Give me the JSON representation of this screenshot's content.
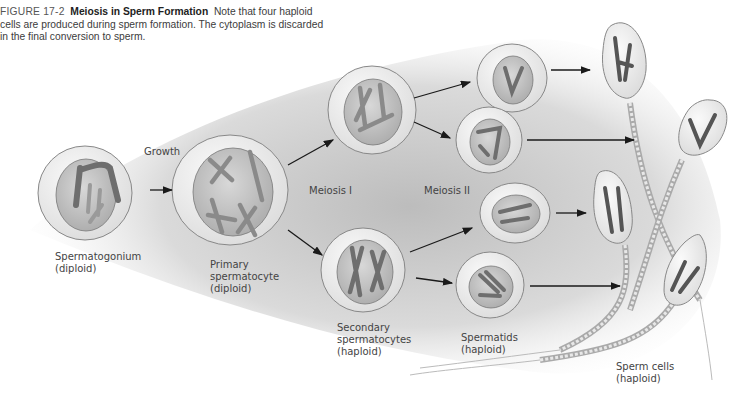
{
  "caption": {
    "figure_number": "FIGURE 17-2",
    "title": "Meiosis in Sperm Formation",
    "text": "Note that four haploid cells are produced during sperm formation. The cytoplasm is discarded in the final conversion to sperm."
  },
  "labels": {
    "growth": "Growth",
    "meiosis_1": "Meiosis I",
    "meiosis_2": "Meiosis II",
    "spermatogonium": [
      "Spermatogonium",
      "(diploid)"
    ],
    "primary": [
      "Primary",
      "spermatocyte",
      "(diploid)"
    ],
    "secondary": [
      "Secondary",
      "spermatocytes",
      "(haploid)"
    ],
    "spermatids": [
      "Spermatids",
      "(haploid)"
    ],
    "sperm": [
      "Sperm cells",
      "(haploid)"
    ]
  },
  "colors": {
    "cell_outer": "#f2f2f2",
    "cell_inner": "#c8c8c8",
    "chromosome": "#8a8a8a",
    "arrow": "#1a1a1a",
    "shadow": "#bdbdbd"
  }
}
